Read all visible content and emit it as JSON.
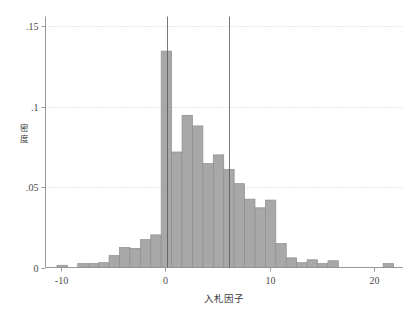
{
  "chart_data": {
    "type": "bar",
    "subtype": "histogram",
    "title": "",
    "xlabel": "入札因子",
    "ylabel": "密度",
    "xlim": [
      -11.5,
      22.8
    ],
    "ylim": [
      0,
      0.156
    ],
    "xticks": [
      -10,
      0,
      10,
      20
    ],
    "xtick_labels": [
      "-10",
      "0",
      "10",
      "20"
    ],
    "yticks": [
      0,
      0.05,
      0.1,
      0.15
    ],
    "ytick_labels": [
      "0",
      ".05",
      ".1",
      ".15"
    ],
    "grid": "horizontal-dotted",
    "legend": "none",
    "bar_fill": "#a8a8a8",
    "bar_stroke": "#8e8e8e",
    "axis_color": "#9a9a9a",
    "grid_color": "#cfcfcf",
    "bin_width": 1.0,
    "bins": [
      {
        "x0": -10.4,
        "x1": -9.4,
        "value": 0.0014
      },
      {
        "x0": -9.4,
        "x1": -8.4,
        "value": 0.0
      },
      {
        "x0": -8.4,
        "x1": -7.4,
        "value": 0.0024
      },
      {
        "x0": -7.4,
        "x1": -6.4,
        "value": 0.0024
      },
      {
        "x0": -6.4,
        "x1": -5.4,
        "value": 0.003
      },
      {
        "x0": -5.4,
        "x1": -4.4,
        "value": 0.0074
      },
      {
        "x0": -4.4,
        "x1": -3.4,
        "value": 0.0125
      },
      {
        "x0": -3.4,
        "x1": -2.4,
        "value": 0.0119
      },
      {
        "x0": -2.4,
        "x1": -1.4,
        "value": 0.0173
      },
      {
        "x0": -1.4,
        "x1": -0.4,
        "value": 0.0203
      },
      {
        "x0": -0.4,
        "x1": 0.6,
        "value": 0.1345
      },
      {
        "x0": 0.6,
        "x1": 1.6,
        "value": 0.0718
      },
      {
        "x0": 1.6,
        "x1": 2.6,
        "value": 0.0946
      },
      {
        "x0": 2.6,
        "x1": 3.6,
        "value": 0.088
      },
      {
        "x0": 3.6,
        "x1": 4.6,
        "value": 0.0646
      },
      {
        "x0": 4.6,
        "x1": 5.6,
        "value": 0.07
      },
      {
        "x0": 5.6,
        "x1": 6.6,
        "value": 0.061
      },
      {
        "x0": 6.6,
        "x1": 7.6,
        "value": 0.0521
      },
      {
        "x0": 7.6,
        "x1": 8.6,
        "value": 0.0425
      },
      {
        "x0": 8.6,
        "x1": 9.6,
        "value": 0.0371
      },
      {
        "x0": 9.6,
        "x1": 10.6,
        "value": 0.0419
      },
      {
        "x0": 10.6,
        "x1": 11.6,
        "value": 0.0149
      },
      {
        "x0": 11.6,
        "x1": 12.6,
        "value": 0.006
      },
      {
        "x0": 12.6,
        "x1": 13.6,
        "value": 0.003
      },
      {
        "x0": 13.6,
        "x1": 14.6,
        "value": 0.0048
      },
      {
        "x0": 14.6,
        "x1": 15.6,
        "value": 0.0024
      },
      {
        "x0": 15.6,
        "x1": 16.6,
        "value": 0.0042
      },
      {
        "x0": 16.6,
        "x1": 17.6,
        "value": 0.0
      },
      {
        "x0": 20.9,
        "x1": 21.9,
        "value": 0.0024
      }
    ],
    "reference_lines": [
      {
        "x": 0.18,
        "y_top": 0.156,
        "label": ""
      },
      {
        "x": 6.1,
        "y_top": 0.156,
        "label": ""
      }
    ]
  },
  "axes": {
    "y_label_chars": [
      "密",
      "度"
    ],
    "x_label_text": "入札因子"
  }
}
